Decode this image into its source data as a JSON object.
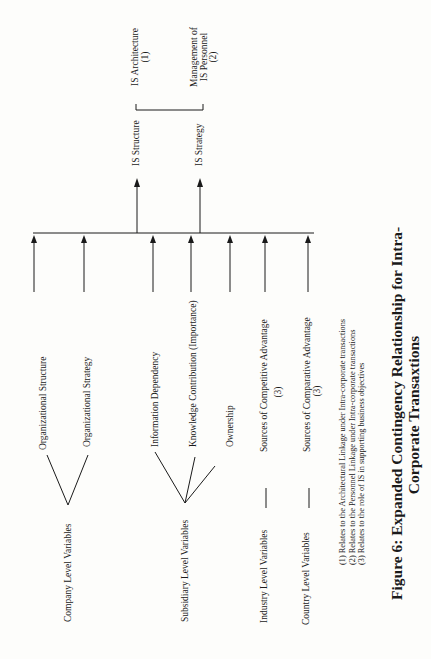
{
  "figure": {
    "caption_line1": "Figure 6:  Expanded Contingency Relationship for Intra-",
    "caption_line2": "Corporate Transaxtions"
  },
  "outcomes": {
    "is_structure": "IS Structure",
    "is_strategy": "IS Strategy",
    "is_architecture": "IS Architecture",
    "is_architecture_note": "(1)",
    "management_line1": "Management of",
    "management_line2": "IS Personnel",
    "management_note": "(2)"
  },
  "groups": {
    "company": {
      "label": "Company Level Variables",
      "children": [
        "Organizational Structure",
        "Organizational Strategy"
      ]
    },
    "subsidiary": {
      "label": "Subsidiary Level Variables",
      "children": [
        "Information Dependency",
        "Knowledge Contribution (Importance)",
        "Ownership"
      ]
    },
    "industry": {
      "label": "Industry Level Variables",
      "child": "Sources of Competitive Advantage",
      "note": "(3)"
    },
    "country": {
      "label": "Country Level Variables",
      "child": "Sources   of Comparative Advantage",
      "note": "(3)"
    }
  },
  "footnotes": [
    "(1) Relates to the Architectural Linkage under Intra-corporate transactions",
    "(2) Relates to the Personnel Linkage under Intra-corporate transactions",
    "(3) Relates to the role of IS in supporting business objectives"
  ],
  "colors": {
    "ink": "#1a1a1a",
    "paper": "#fdfdfb"
  }
}
